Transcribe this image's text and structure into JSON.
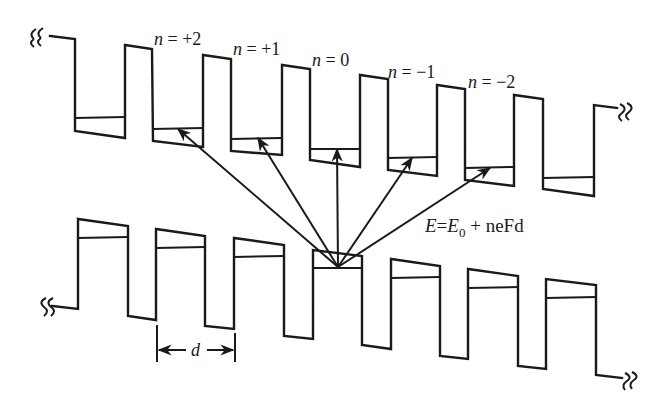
{
  "figure": {
    "labels": [
      {
        "id": "n_plus2",
        "var": "n",
        "rest": " = +2",
        "x": 154,
        "y": 45
      },
      {
        "id": "n_plus1",
        "var": "n",
        "rest": " = +1",
        "x": 233,
        "y": 55
      },
      {
        "id": "n_0",
        "var": "n",
        "rest": " = 0",
        "x": 312,
        "y": 66
      },
      {
        "id": "n_minus1",
        "var": "n",
        "rest": " = −1",
        "x": 388,
        "y": 78
      },
      {
        "id": "n_minus2",
        "var": "n",
        "rest": " = −2",
        "x": 468,
        "y": 88
      }
    ],
    "equation": {
      "E": "E",
      "eq": "=",
      "E0": "E",
      "sub": "0",
      "rest": " + neFd"
    },
    "period_label": "d",
    "colors": {
      "ink": "#1a1a1a",
      "background": "#ffffff"
    }
  }
}
